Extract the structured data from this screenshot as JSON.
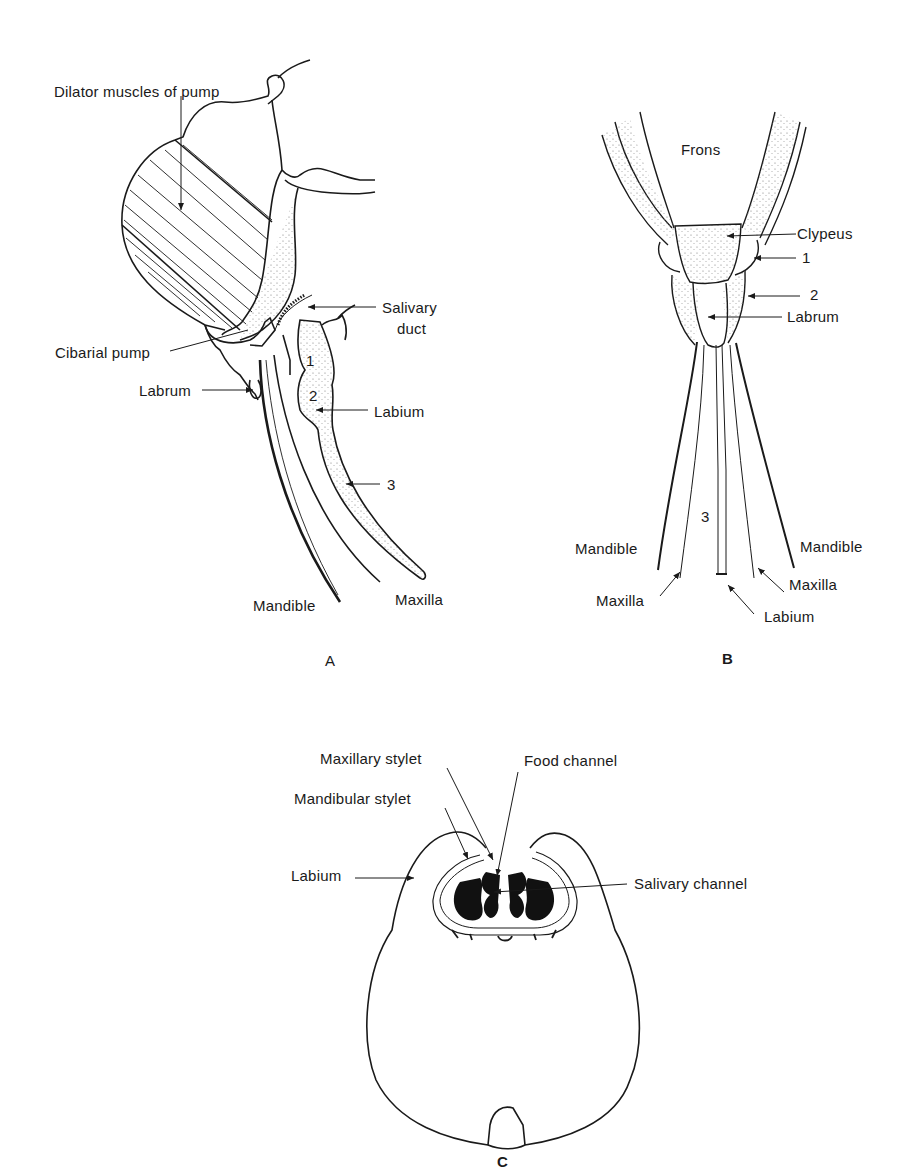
{
  "figure": {
    "panels": [
      {
        "id": "A",
        "letter": "A",
        "labels": {
          "dilator": "Dilator muscles of pump",
          "salivary_duct_1": "Salivary",
          "salivary_duct_2": "duct",
          "cibarial_pump": "Cibarial pump",
          "labrum": "Labrum",
          "labium": "Labium",
          "seg3": "3",
          "mandible": "Mandible",
          "maxilla": "Maxilla",
          "seg1": "1",
          "seg2": "2"
        }
      },
      {
        "id": "B",
        "letter": "B",
        "labels": {
          "frons": "Frons",
          "clypeus": "Clypeus",
          "seg1": "1",
          "seg2": "2",
          "labrum": "Labrum",
          "seg3": "3",
          "mandible_left": "Mandible",
          "mandible_right": "Mandible",
          "maxilla_left": "Maxilla",
          "maxilla_right": "Maxilla",
          "labium": "Labium"
        }
      },
      {
        "id": "C",
        "letter": "C",
        "labels": {
          "maxillary_stylet": "Maxillary stylet",
          "food_channel": "Food channel",
          "mandibular_stylet": "Mandibular stylet",
          "labium": "Labium",
          "salivary_channel": "Salivary channel"
        }
      }
    ],
    "colors": {
      "ink": "#1a1a1a",
      "background": "#ffffff",
      "stipple": "#8a8a8a"
    }
  }
}
